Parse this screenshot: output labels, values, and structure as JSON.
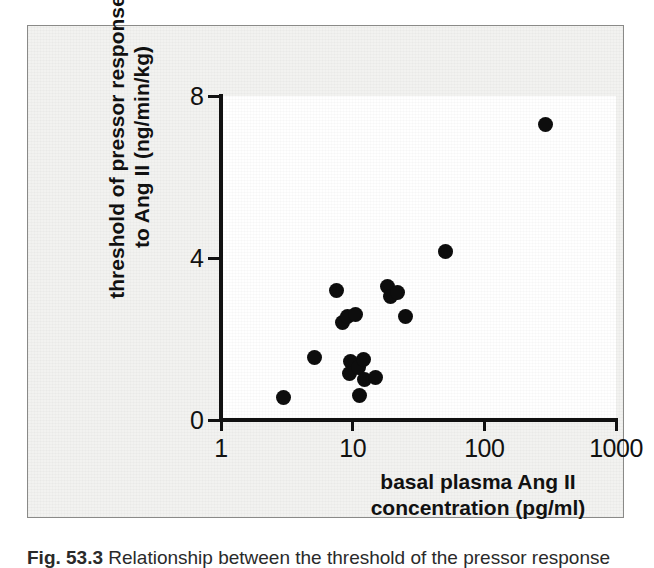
{
  "figure": {
    "caption_label": "Fig. 53.3",
    "caption_text": "Relationship between the threshold of the pressor response"
  },
  "chart_data": {
    "type": "scatter",
    "title": "",
    "xlabel": "basal plasma Ang II concentration (pg/ml)",
    "xlabel_line1": "basal plasma Ang II",
    "xlabel_line2": "concentration (pg/ml)",
    "ylabel": "threshold of pressor response to Ang II (ng/min/kg)",
    "ylabel_line1": "threshold of pressor response",
    "ylabel_line2": "to Ang II (ng/min/kg)",
    "xscale": "log",
    "yscale": "linear",
    "xlim": [
      1,
      1000
    ],
    "ylim": [
      0,
      8
    ],
    "xticks": [
      1,
      10,
      100,
      1000
    ],
    "xtick_labels": [
      "1",
      "10",
      "100",
      "1000"
    ],
    "yticks": [
      0,
      4,
      8
    ],
    "ytick_labels": [
      "0",
      "4",
      "8"
    ],
    "grid": false,
    "legend": null,
    "marker": "filled-circle",
    "marker_color": "#0d0d0d",
    "n_points": 19,
    "points": [
      {
        "x": 3.0,
        "y": 0.55
      },
      {
        "x": 5.1,
        "y": 1.55
      },
      {
        "x": 7.6,
        "y": 3.2
      },
      {
        "x": 8.3,
        "y": 2.4
      },
      {
        "x": 9.1,
        "y": 2.55
      },
      {
        "x": 10.5,
        "y": 2.6
      },
      {
        "x": 9.6,
        "y": 1.45
      },
      {
        "x": 9.5,
        "y": 1.15
      },
      {
        "x": 11.0,
        "y": 1.3
      },
      {
        "x": 11.3,
        "y": 0.6
      },
      {
        "x": 12.0,
        "y": 1.5
      },
      {
        "x": 12.3,
        "y": 1.0
      },
      {
        "x": 15.0,
        "y": 1.05
      },
      {
        "x": 18.5,
        "y": 3.3
      },
      {
        "x": 19.5,
        "y": 3.05
      },
      {
        "x": 22.0,
        "y": 3.15
      },
      {
        "x": 25.0,
        "y": 2.55
      },
      {
        "x": 51.0,
        "y": 4.15
      },
      {
        "x": 290.0,
        "y": 7.3
      }
    ]
  },
  "colors": {
    "panel_background": "#f2f2f0",
    "panel_border": "#8a8a88",
    "plot_background": "#ffffff",
    "axis": "#111111",
    "marker": "#0d0d0d",
    "text": "#111111"
  }
}
